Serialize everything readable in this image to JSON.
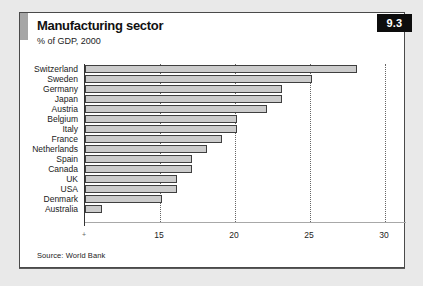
{
  "page": {
    "background": "#e9e9e9"
  },
  "panel": {
    "background": "#ffffff",
    "border_color": "#4a4a4a",
    "accent_bar_color": "#a6a6a6"
  },
  "figure_badge": {
    "label": "9.3",
    "background": "#0d0d0d",
    "text_color": "#ffffff"
  },
  "header": {
    "title": "Manufacturing sector",
    "subtitle": "% of GDP, 2000"
  },
  "footer": {
    "source": "Source: World Bank"
  },
  "chart_data": {
    "type": "bar",
    "orientation": "horizontal",
    "title": "Manufacturing sector",
    "subtitle": "% of GDP, 2000",
    "xlabel": "",
    "ylabel": "",
    "categories": [
      "Switzerland",
      "Sweden",
      "Germany",
      "Japan",
      "Austria",
      "Belgium",
      "Italy",
      "France",
      "Netherlands",
      "Spain",
      "Canada",
      "UK",
      "USA",
      "Denmark",
      "Australia"
    ],
    "values": [
      28,
      25,
      23,
      23,
      22,
      20,
      20,
      19,
      18,
      17,
      17,
      16,
      16,
      15,
      11
    ],
    "xlim": [
      10,
      31.4
    ],
    "x_ticks": [
      15,
      20,
      25,
      30
    ],
    "axis_origin_marker": "+",
    "grid": "vertical dotted lines at x ticks",
    "legend": "none",
    "bar_fill": "#cccccc",
    "bar_border": "#3f3f3f"
  }
}
